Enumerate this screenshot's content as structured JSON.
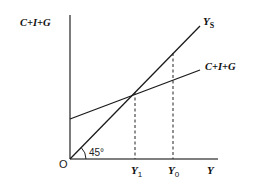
{
  "diagram": {
    "y_axis_label": "C+I+G",
    "x_axis_label": "Y",
    "origin_label": "O",
    "angle_label": "45°",
    "lines": [
      {
        "name": "aggregate-supply-line",
        "label": "Y",
        "label_sub": "S",
        "style": "solid"
      },
      {
        "name": "aggregate-expenditure-line",
        "label": "C+I+G",
        "style": "solid"
      }
    ],
    "x_ticks": [
      {
        "label": "Y",
        "sub": "1",
        "meaning": "equilibrium income"
      },
      {
        "label": "Y",
        "sub": "0",
        "meaning": "full-employment income"
      }
    ],
    "colors": {
      "line": "#1a1a1a",
      "axis": "#333333",
      "background": "#ffffff"
    }
  }
}
